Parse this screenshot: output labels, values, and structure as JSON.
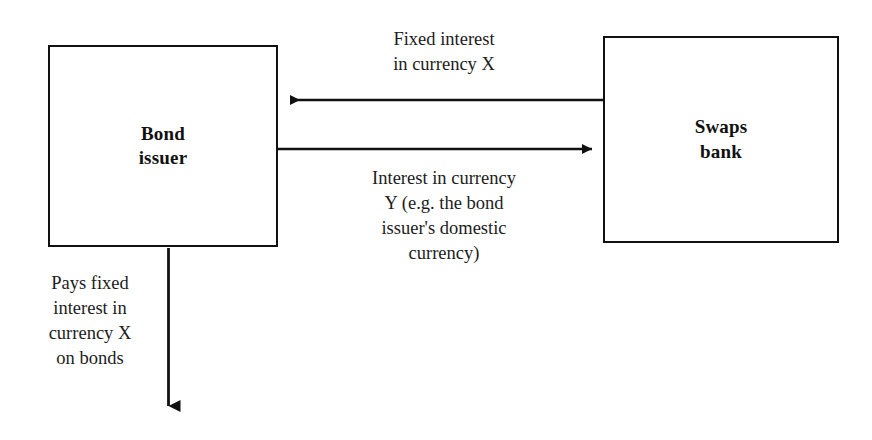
{
  "diagram": {
    "background_color": "#ffffff",
    "line_color": "#111111",
    "text_color": "#1c1c1c",
    "nodes": [
      {
        "id": "bond-issuer",
        "label": "Bond\nissuer",
        "shape": "rectangle"
      },
      {
        "id": "swaps-bank",
        "label": "Swaps\nbank",
        "shape": "rectangle"
      }
    ],
    "edges": [
      {
        "id": "fixed-interest-x",
        "from": "swaps-bank",
        "to": "bond-issuer",
        "direction": "leftward",
        "label": "Fixed interest\nin currency X"
      },
      {
        "id": "interest-currency-y",
        "from": "bond-issuer",
        "to": "swaps-bank",
        "direction": "rightward",
        "label": "Interest in currency\nY (e.g. the bond\nissuer's domestic\ncurrency)"
      },
      {
        "id": "pays-fixed-interest-on-bonds",
        "from": "bond-issuer",
        "to": "bondholders",
        "direction": "downward",
        "label": "Pays fixed\ninterest in\ncurrency X\non bonds"
      }
    ]
  }
}
